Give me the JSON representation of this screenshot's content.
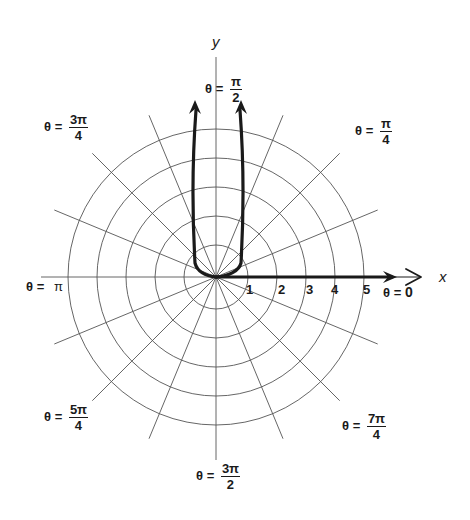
{
  "figure": {
    "axes": {
      "x_label": "x",
      "y_label": "y"
    },
    "radial_ticks": [
      "1",
      "2",
      "3",
      "4",
      "5"
    ],
    "angle_labels": {
      "zero": {
        "theta": "θ",
        "eq": "=",
        "value": "0"
      },
      "quarter": {
        "theta": "θ",
        "eq": "=",
        "num": "π",
        "den": "4"
      },
      "half": {
        "theta": "θ",
        "eq": "=",
        "num": "π",
        "den": "2"
      },
      "three_quarter": {
        "theta": "θ",
        "eq": "=",
        "num": "3π",
        "den": "4"
      },
      "pi": {
        "theta": "θ",
        "eq": "=",
        "value": "π"
      },
      "five_quarter": {
        "theta": "θ",
        "eq": "=",
        "num": "5π",
        "den": "4"
      },
      "three_half": {
        "theta": "θ",
        "eq": "=",
        "num": "3π",
        "den": "2"
      },
      "seven_quarter": {
        "theta": "θ",
        "eq": "=",
        "num": "7π",
        "den": "4"
      }
    },
    "colors": {
      "ink": "#1a1a1a",
      "grid": "#555555",
      "background": "#ffffff"
    }
  },
  "chart_data": {
    "type": "polar-diagram",
    "center_px": [
      216,
      277
    ],
    "unit_radius_px": 29,
    "circles": [
      1,
      2,
      3,
      4,
      5
    ],
    "radial_lines_count": 16,
    "radial_line_step": "π/8",
    "angle_labels": [
      "0",
      "π/4",
      "π/2",
      "3π/4",
      "π",
      "5π/4",
      "3π/2",
      "7π/4"
    ],
    "curves": [
      {
        "name": "positive-x-ray",
        "description": "thick arrow along θ = 0 from origin past r = 5"
      },
      {
        "name": "u-shaped-curve",
        "description": "thick curve from origin rising along two near-vertical branches toward θ = π/2 with arrowheads"
      }
    ]
  }
}
